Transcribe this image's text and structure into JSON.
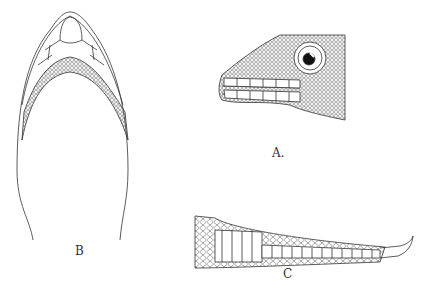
{
  "figure": {
    "panels": [
      {
        "id": "A",
        "label": "A.",
        "description": "Lateral view of lizard head with eye and labial scales"
      },
      {
        "id": "B",
        "label": "B",
        "description": "Ventral view of head showing chin shields and gular scales"
      },
      {
        "id": "C",
        "label": "C",
        "description": "Toe showing subdigital lamellae and claw"
      }
    ]
  },
  "colors": {
    "ink": "#333333",
    "background": "#ffffff"
  }
}
